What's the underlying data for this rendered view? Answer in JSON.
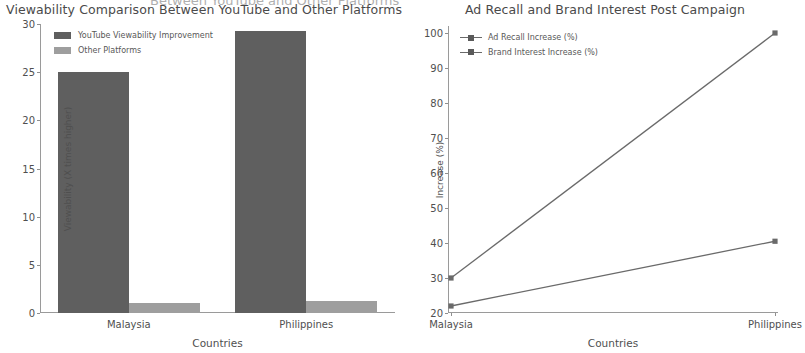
{
  "ghost_header": "Between YouTube and Other Platforms",
  "panels": {
    "left": {
      "title": "Viewability Comparison Between YouTube and Other Platforms",
      "legend": [
        {
          "label": "YouTube Viewability Improvement",
          "color": "#5f5f5f",
          "icon": "legend-swatch-icon"
        },
        {
          "label": "Other Platforms",
          "color": "#9e9e9e",
          "icon": "legend-swatch-icon"
        }
      ]
    },
    "right": {
      "title": "Ad Recall and Brand Interest Post Campaign",
      "legend": [
        {
          "label": "Ad Recall Increase (%)",
          "color": "#6a6a6a",
          "icon": "legend-line-marker-icon"
        },
        {
          "label": "Brand Interest Increase (%)",
          "color": "#6a6a6a",
          "icon": "legend-line-marker-icon"
        }
      ]
    }
  },
  "chart_data": [
    {
      "type": "bar",
      "title": "Viewability Comparison Between YouTube and Other Platforms",
      "xlabel": "Countries",
      "ylabel": "Viewability (X times higher)",
      "categories": [
        "Malaysia",
        "Philippines"
      ],
      "series": [
        {
          "name": "YouTube Viewability Improvement",
          "values": [
            25.0,
            29.3
          ],
          "color": "#5f5f5f"
        },
        {
          "name": "Other Platforms",
          "values": [
            1.0,
            1.2
          ],
          "color": "#9e9e9e"
        }
      ],
      "ylim": [
        0,
        30
      ],
      "yticks": [
        0,
        5,
        10,
        15,
        20,
        25,
        30
      ],
      "ytick_labels": [
        "0",
        "5",
        "10",
        "15",
        "20",
        "25",
        "30"
      ],
      "grid": false,
      "legend_position": "upper left"
    },
    {
      "type": "line",
      "title": "Ad Recall and Brand Interest Post Campaign",
      "xlabel": "Countries",
      "ylabel": "Increase (%)",
      "x": [
        "Malaysia",
        "Philippines"
      ],
      "series": [
        {
          "name": "Ad Recall Increase (%)",
          "values": [
            30,
            100
          ],
          "color": "#6a6a6a",
          "marker": "square"
        },
        {
          "name": "Brand Interest Increase (%)",
          "values": [
            22,
            40.5
          ],
          "color": "#6a6a6a",
          "marker": "square"
        }
      ],
      "ylim": [
        20,
        102
      ],
      "yticks": [
        20,
        30,
        40,
        50,
        60,
        70,
        80,
        90,
        100
      ],
      "ytick_labels": [
        "20",
        "30",
        "40",
        "50",
        "60",
        "70",
        "80",
        "90",
        "100"
      ],
      "grid": false,
      "legend_position": "upper left"
    }
  ]
}
